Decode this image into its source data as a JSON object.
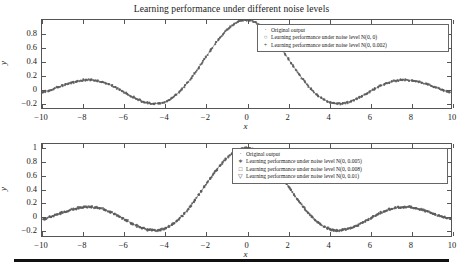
{
  "figure": {
    "title": "Learning performance under different noise levels",
    "bottom_rule": true
  },
  "chart_data": [
    {
      "type": "scatter",
      "panel": "top",
      "title": "Learning performance under different noise levels",
      "xlabel": "x",
      "ylabel": "y",
      "xlim": [
        -10,
        10
      ],
      "ylim": [
        -0.28,
        1.0
      ],
      "grid": false,
      "xticks": [
        -10,
        -8,
        -6,
        -4,
        -2,
        0,
        2,
        4,
        6,
        8,
        10
      ],
      "xticklabels": [
        "−10",
        "−8",
        "−6",
        "−4",
        "−2",
        "0",
        "2",
        "4",
        "6",
        "8",
        "10"
      ],
      "yticks": [
        -0.2,
        0,
        0.2,
        0.4,
        0.6,
        0.8
      ],
      "yticklabels": [
        "−0.2",
        "0",
        "0.2",
        "0.4",
        "0.6",
        "0.8"
      ],
      "legend_position": "upper right",
      "function": "sinc-like: sin(x)/x",
      "series": [
        {
          "name": "Original output",
          "marker": "·",
          "marker_name": "dot",
          "color": "#555555"
        },
        {
          "name": "Learning performance under noise level N(0, 0)",
          "marker": "○",
          "marker_name": "open-circle",
          "color": "#555555",
          "noise_mean": 0,
          "noise_variance": 0
        },
        {
          "name": "Learning performance under noise level N(0, 0.002)",
          "marker": "+",
          "marker_name": "plus",
          "color": "#555555",
          "noise_mean": 0,
          "noise_variance": 0.002
        }
      ],
      "x": [
        -10,
        -9.6,
        -9.2,
        -8.8,
        -8.4,
        -8,
        -7.6,
        -7.2,
        -6.8,
        -6.4,
        -6,
        -5.6,
        -5.2,
        -4.8,
        -4.4,
        -4,
        -3.6,
        -3.2,
        -2.8,
        -2.4,
        -2,
        -1.6,
        -1.2,
        -0.8,
        -0.4,
        0,
        0.4,
        0.8,
        1.2,
        1.6,
        2,
        2.4,
        2.8,
        3.2,
        3.6,
        4,
        4.4,
        4.8,
        5.2,
        5.6,
        6,
        6.4,
        6.8,
        7.2,
        7.6,
        8,
        8.4,
        8.8,
        9.2,
        9.6,
        10
      ],
      "y": [
        -0.054,
        -0.019,
        0.025,
        0.069,
        0.105,
        0.124,
        0.131,
        0.122,
        0.075,
        0.023,
        -0.047,
        -0.11,
        -0.17,
        -0.205,
        -0.216,
        -0.189,
        -0.123,
        -0.018,
        0.12,
        0.282,
        0.455,
        0.624,
        0.777,
        0.897,
        0.974,
        1.0,
        0.974,
        0.897,
        0.777,
        0.624,
        0.455,
        0.282,
        0.12,
        -0.018,
        -0.123,
        -0.189,
        -0.216,
        -0.205,
        -0.17,
        -0.11,
        -0.047,
        0.023,
        0.075,
        0.122,
        0.131,
        0.124,
        0.105,
        0.069,
        0.025,
        -0.019,
        -0.054
      ]
    },
    {
      "type": "scatter",
      "panel": "bottom",
      "title": "",
      "xlabel": "x",
      "ylabel": "y",
      "xlim": [
        -10,
        10
      ],
      "ylim": [
        -0.3,
        1.06
      ],
      "grid": false,
      "xticks": [
        -10,
        -8,
        -6,
        -4,
        -2,
        0,
        2,
        4,
        6,
        8,
        10
      ],
      "xticklabels": [
        "−10",
        "−8",
        "−6",
        "−4",
        "−2",
        "0",
        "2",
        "4",
        "6",
        "8",
        "10"
      ],
      "yticks": [
        -0.2,
        0,
        0.2,
        0.4,
        0.6,
        0.8,
        1
      ],
      "yticklabels": [
        "−0.2",
        "0",
        "0.2",
        "0.4",
        "0.6",
        "0.8",
        "1"
      ],
      "legend_position": "upper right",
      "function": "sinc-like: sin(x)/x",
      "series": [
        {
          "name": "Original output",
          "marker": "·",
          "marker_name": "dot",
          "color": "#555555"
        },
        {
          "name": "Learning performance under noise level N(0, 0.005)",
          "marker": "∗",
          "marker_name": "asterisk",
          "color": "#555555",
          "noise_mean": 0,
          "noise_variance": 0.005
        },
        {
          "name": "Learning performance under noise level N(0, 0.008)",
          "marker": "□",
          "marker_name": "open-square",
          "color": "#555555",
          "noise_mean": 0,
          "noise_variance": 0.008
        },
        {
          "name": "Learning performance under noise level N(0, 0.01)",
          "marker": "▽",
          "marker_name": "open-down-triangle",
          "color": "#555555",
          "noise_mean": 0,
          "noise_variance": 0.01
        }
      ],
      "x": [
        -10,
        -9.6,
        -9.2,
        -8.8,
        -8.4,
        -8,
        -7.6,
        -7.2,
        -6.8,
        -6.4,
        -6,
        -5.6,
        -5.2,
        -4.8,
        -4.4,
        -4,
        -3.6,
        -3.2,
        -2.8,
        -2.4,
        -2,
        -1.6,
        -1.2,
        -0.8,
        -0.4,
        0,
        0.4,
        0.8,
        1.2,
        1.6,
        2,
        2.4,
        2.8,
        3.2,
        3.6,
        4,
        4.4,
        4.8,
        5.2,
        5.6,
        6,
        6.4,
        6.8,
        7.2,
        7.6,
        8,
        8.4,
        8.8,
        9.2,
        9.6,
        10
      ],
      "y": [
        -0.054,
        -0.019,
        0.025,
        0.069,
        0.105,
        0.124,
        0.131,
        0.122,
        0.075,
        0.023,
        -0.047,
        -0.11,
        -0.17,
        -0.205,
        -0.216,
        -0.189,
        -0.123,
        -0.018,
        0.12,
        0.282,
        0.455,
        0.624,
        0.777,
        0.897,
        0.974,
        1.0,
        0.974,
        0.897,
        0.777,
        0.624,
        0.455,
        0.282,
        0.12,
        -0.018,
        -0.123,
        -0.189,
        -0.216,
        -0.205,
        -0.17,
        -0.11,
        -0.047,
        0.023,
        0.075,
        0.122,
        0.131,
        0.124,
        0.105,
        0.069,
        0.025,
        -0.019,
        -0.054
      ]
    }
  ]
}
